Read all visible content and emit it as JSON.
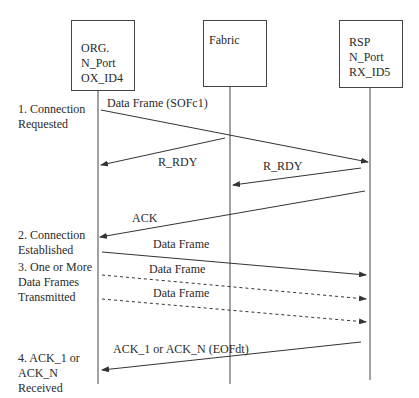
{
  "participants": [
    {
      "id": "org",
      "lines": [
        "ORG.",
        "N_Port",
        "OX_ID4"
      ]
    },
    {
      "id": "fabric",
      "lines": [
        "Fabric"
      ]
    },
    {
      "id": "rsp",
      "lines": [
        "RSP",
        "N_Port",
        "RX_ID5"
      ]
    }
  ],
  "steps": [
    {
      "lines": [
        "1. Connection",
        "Requested"
      ]
    },
    {
      "lines": [
        "2. Connection",
        "Established"
      ]
    },
    {
      "lines": [
        "3. One or More",
        "Data Frames",
        "Transmitted"
      ]
    },
    {
      "lines": [
        "4. ACK_1 or",
        "ACK_N",
        "Received"
      ]
    }
  ],
  "messages": [
    {
      "label": "Data Frame (SOFc1)",
      "from": "ORG",
      "to": "RSP",
      "style": "solid"
    },
    {
      "label": "R_RDY",
      "from": "Fabric",
      "to": "ORG",
      "style": "solid"
    },
    {
      "label": "R_RDY",
      "from": "RSP",
      "to": "Fabric",
      "style": "solid"
    },
    {
      "label": "ACK",
      "from": "RSP",
      "to": "ORG",
      "style": "solid"
    },
    {
      "label": "Data Frame",
      "from": "ORG",
      "to": "RSP",
      "style": "solid"
    },
    {
      "label": "Data Frame",
      "from": "ORG",
      "to": "RSP",
      "style": "dashed"
    },
    {
      "label": "Data Frame",
      "from": "ORG",
      "to": "RSP",
      "style": "dashed"
    },
    {
      "label": "ACK_1 or ACK_N (EOFdt)",
      "from": "RSP",
      "to": "ORG",
      "style": "solid"
    }
  ]
}
